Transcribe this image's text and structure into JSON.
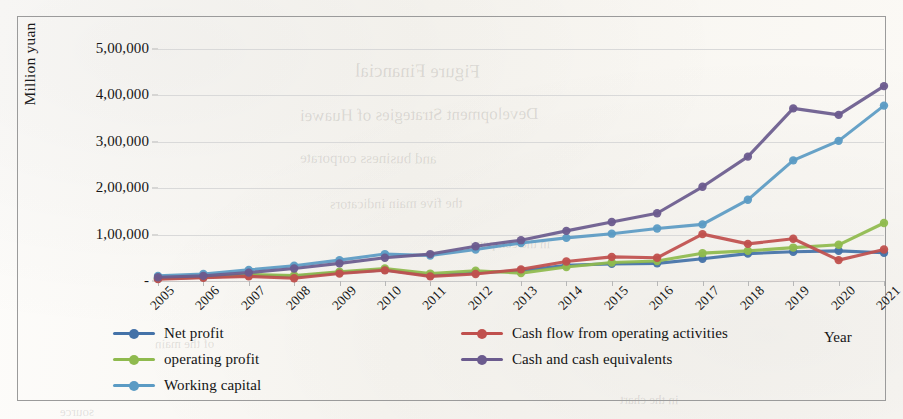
{
  "chart_data": {
    "type": "line",
    "title": "",
    "xlabel": "Year",
    "ylabel": "Million yuan",
    "grid": true,
    "legend_position": "bottom",
    "ylim": [
      0,
      500000
    ],
    "ytick_labels": [
      "5,00,000",
      "4,00,000",
      "3,00,000",
      "2,00,000",
      "1,00,000",
      "-"
    ],
    "ytick_values": [
      500000,
      400000,
      300000,
      200000,
      100000,
      0
    ],
    "categories": [
      "2005",
      "2006",
      "2007",
      "2008",
      "2009",
      "2010",
      "2011",
      "2012",
      "2013",
      "2014",
      "2015",
      "2016",
      "2017",
      "2018",
      "2019",
      "2020",
      "2021"
    ],
    "x": [
      2005,
      2006,
      2007,
      2008,
      2009,
      2010,
      2011,
      2012,
      2013,
      2014,
      2015,
      2016,
      2017,
      2018,
      2019,
      2020,
      2021
    ],
    "series": [
      {
        "name": "Net profit",
        "color": "#4472a8",
        "values": [
          5000,
          8000,
          12000,
          10000,
          18000,
          24000,
          12000,
          18000,
          22000,
          34000,
          37000,
          38000,
          48000,
          59000,
          63000,
          65000,
          61000
        ]
      },
      {
        "name": "operating profit",
        "color": "#8fba4e",
        "values": [
          6000,
          9000,
          14000,
          12000,
          20000,
          27000,
          16000,
          22000,
          17000,
          30000,
          40000,
          43000,
          60000,
          65000,
          72000,
          78000,
          125000
        ]
      },
      {
        "name": "Working capital",
        "color": "#5b9bc4",
        "values": [
          11000,
          15000,
          24000,
          33000,
          45000,
          58000,
          55000,
          68000,
          82000,
          93000,
          102000,
          113000,
          122000,
          175000,
          260000,
          302000,
          378000
        ]
      },
      {
        "name": "Cash flow from operating activities",
        "color": "#c0504d",
        "values": [
          4000,
          7000,
          10000,
          6000,
          16000,
          23000,
          10000,
          15000,
          25000,
          42000,
          52000,
          50000,
          101000,
          80000,
          91000,
          45000,
          68000
        ]
      },
      {
        "name": "Cash and cash equivalents",
        "color": "#6b5b8e",
        "values": [
          8000,
          11000,
          18000,
          27000,
          38000,
          50000,
          58000,
          75000,
          88000,
          108000,
          127000,
          146000,
          203000,
          268000,
          372000,
          358000,
          420000
        ]
      }
    ]
  },
  "axes": {
    "y_title": "Million yuan",
    "x_title": "Year"
  },
  "legend": {
    "items": [
      {
        "label": "Net profit",
        "color": "#4472a8"
      },
      {
        "label": "operating profit",
        "color": "#8fba4e"
      },
      {
        "label": "Working capital",
        "color": "#5b9bc4"
      },
      {
        "label": "Cash flow from operating activities",
        "color": "#c0504d"
      },
      {
        "label": "Cash and cash equivalents",
        "color": "#6b5b8e"
      }
    ]
  },
  "background_artifacts": {
    "ghost_lines": [
      {
        "text": "Figure   Financial",
        "x": 355,
        "y": 60,
        "size": 19
      },
      {
        "text": "Development Strategies of Huawei",
        "x": 300,
        "y": 105,
        "size": 17
      },
      {
        "text": "and  business  corporate",
        "x": 300,
        "y": 150,
        "size": 15
      },
      {
        "text": "the  five  main  indicators",
        "x": 330,
        "y": 196,
        "size": 14
      },
      {
        "text": "in the company",
        "x": 470,
        "y": 236,
        "size": 13
      },
      {
        "text": "of the  main",
        "x": 155,
        "y": 336,
        "size": 13
      },
      {
        "text": "in   the   chart",
        "x": 620,
        "y": 392,
        "size": 13
      },
      {
        "text": "source",
        "x": 60,
        "y": 404,
        "size": 13
      }
    ]
  }
}
